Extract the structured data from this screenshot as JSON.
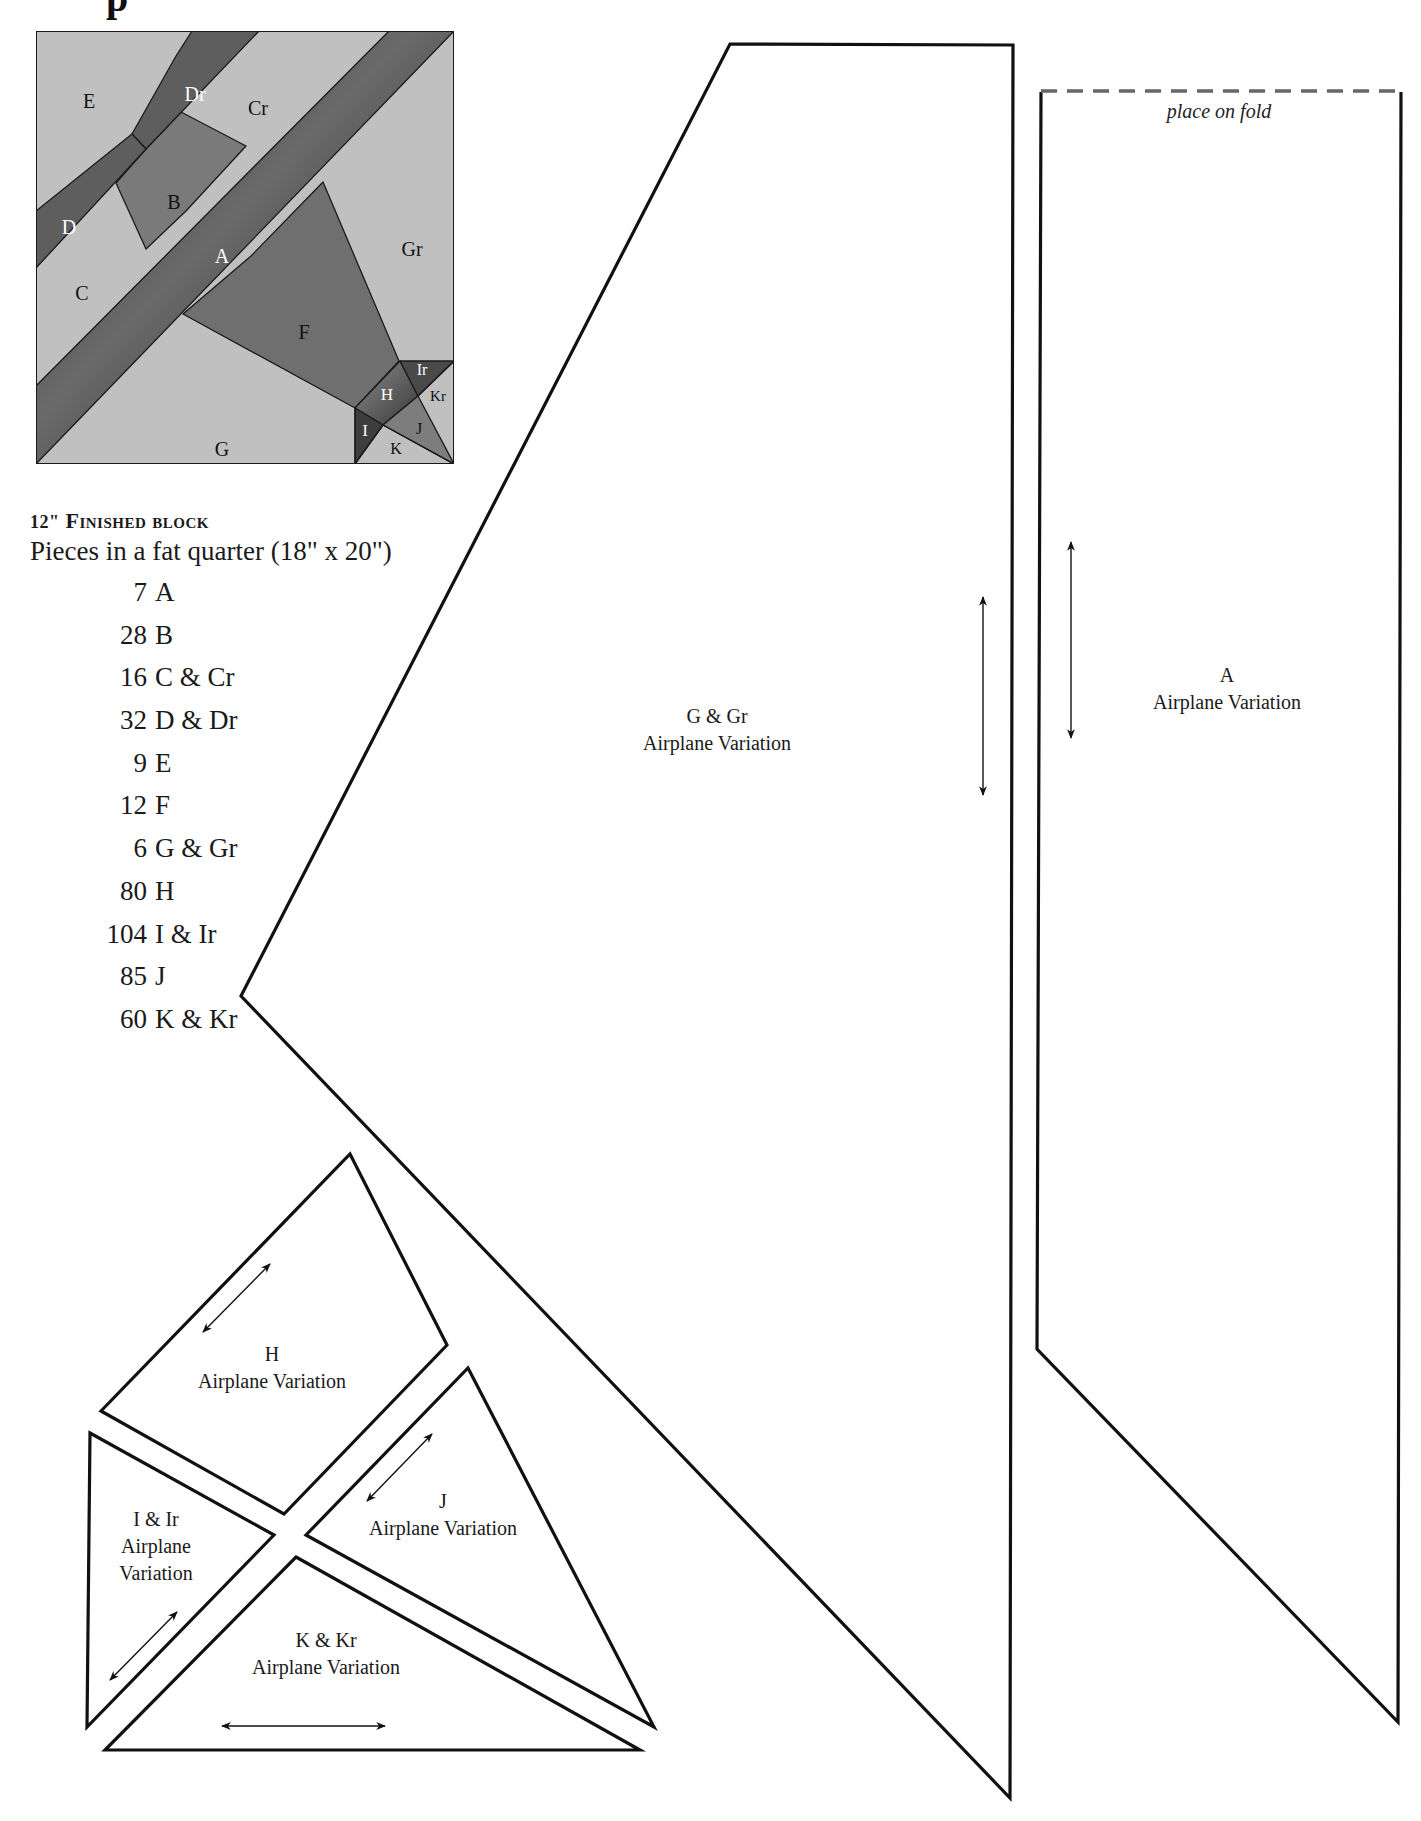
{
  "page": {
    "title_fragment": "p"
  },
  "block_diagram": {
    "labels": {
      "E": "E",
      "Dr": "Dr",
      "Cr": "Cr",
      "B": "B",
      "D": "D",
      "A": "A",
      "Gr": "Gr",
      "C": "C",
      "F": "F",
      "G": "G",
      "H": "H",
      "Ir": "Ir",
      "Kr": "Kr",
      "I": "I",
      "J": "J",
      "K": "K"
    },
    "colors": {
      "light": "#bdbdbd",
      "medium": "#7a7a7a",
      "dark": "#3a3a3a",
      "outline": "#1a1a1a"
    }
  },
  "info": {
    "heading_num": "12\"",
    "heading_text": "Finished block",
    "fat_quarter": "Pieces in a fat quarter (18\" x 20\")",
    "counts": [
      {
        "qty": "7",
        "piece": "A"
      },
      {
        "qty": "28",
        "piece": "B"
      },
      {
        "qty": "16",
        "piece": "C & Cr"
      },
      {
        "qty": "32",
        "piece": "D & Dr"
      },
      {
        "qty": "9",
        "piece": "E"
      },
      {
        "qty": "12",
        "piece": "F"
      },
      {
        "qty": "6",
        "piece": "G & Gr"
      },
      {
        "qty": "80",
        "piece": "H"
      },
      {
        "qty": "104",
        "piece": "I & Ir"
      },
      {
        "qty": "85",
        "piece": "J"
      },
      {
        "qty": "60",
        "piece": "K & Kr"
      }
    ]
  },
  "patterns": {
    "g": {
      "name": "G & Gr",
      "subtitle": "Airplane Variation"
    },
    "a": {
      "name": "A",
      "subtitle": "Airplane Variation",
      "fold_note": "place on fold"
    },
    "h": {
      "name": "H",
      "subtitle": "Airplane Variation"
    },
    "i": {
      "name": "I & Ir",
      "line2": "Airplane",
      "line3": "Variation"
    },
    "j": {
      "name": "J",
      "subtitle": "Airplane Variation"
    },
    "k": {
      "name": "K & Kr",
      "subtitle": "Airplane Variation"
    }
  }
}
